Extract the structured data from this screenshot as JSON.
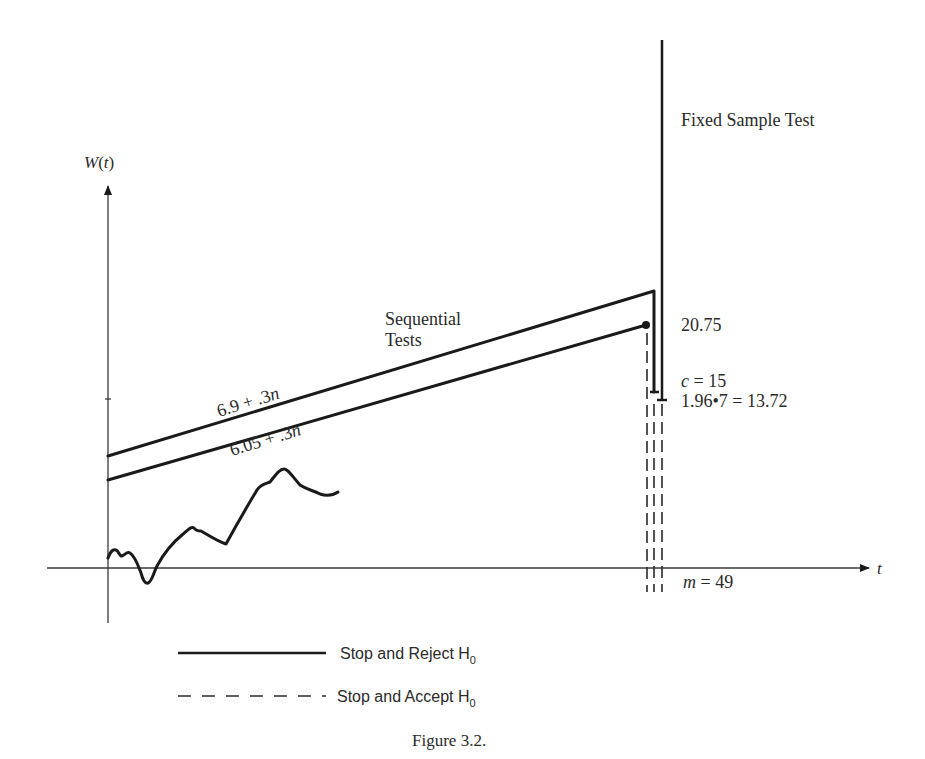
{
  "figure": {
    "caption": "Figure 3.2.",
    "y_axis_label": "W(t)",
    "y_axis_label_parts": {
      "func": "W",
      "open": "(",
      "var": "t",
      "close": ")"
    },
    "x_axis_label": "t",
    "fixed_sample_label": "Fixed Sample Test",
    "sequential_label_line1": "Sequential",
    "sequential_label_line2": "Tests",
    "upper_boundary_label": "6.9 + .3n",
    "upper_boundary_parts": {
      "const": "6.9 + .3",
      "var": "n"
    },
    "lower_boundary_label": "6.05 + .3n",
    "lower_boundary_parts": {
      "const": "6.05 + .3",
      "var": "n"
    },
    "value_upper_end": "20.75",
    "c_label": "c = 15",
    "c_parts": {
      "var": "c",
      "rest": " = 15"
    },
    "fixed_threshold_label": "1.96•7 = 13.72",
    "m_label": "m = 49",
    "m_parts": {
      "var": "m",
      "rest": " = 49"
    }
  },
  "legend": {
    "items": [
      {
        "style": "solid",
        "label": "Stop and Reject H",
        "subscript": "0"
      },
      {
        "style": "dashed",
        "label": "Stop and Accept H",
        "subscript": "0"
      }
    ]
  },
  "colors": {
    "line": "#1a1a1a",
    "text": "#2a2a2a",
    "background": "#ffffff"
  }
}
